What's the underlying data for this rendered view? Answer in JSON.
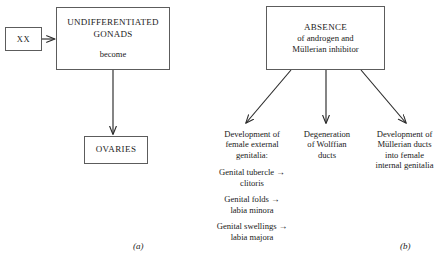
{
  "figure": {
    "background": "#ffffff",
    "line_color": "#5c5c5c",
    "arrow_color": "#2a2a2a",
    "text_color": "#1a1a1a"
  },
  "panel_a": {
    "label": "(a)",
    "karyotype_box": {
      "text": "XX"
    },
    "gonad_box": {
      "title_line1": "UNDIFFERENTIATED",
      "title_line2": "GONADS",
      "subtitle": "become"
    },
    "outcome_box": {
      "text": "OVARIES"
    }
  },
  "panel_b": {
    "label": "(b)",
    "absence_box": {
      "title": "ABSENCE",
      "line2": "of androgen and",
      "line3": "Müllerian inhibitor"
    },
    "outcomes": [
      {
        "name": "female-external-genitalia",
        "heading_line1": "Development of",
        "heading_line2": "female external",
        "heading_line3": "genitalia:",
        "items": [
          {
            "source": "Genital tubercle →",
            "result": "clitoris"
          },
          {
            "source": "Genital folds →",
            "result": "labia minora"
          },
          {
            "source": "Genital swellings →",
            "result": "labia majora"
          }
        ]
      },
      {
        "name": "wolffian-duct-degeneration",
        "line1": "Degeneration",
        "line2": "of Wolffian",
        "line3": "ducts"
      },
      {
        "name": "mullerian-duct-development",
        "line1": "Development of",
        "line2": "Müllerian ducts",
        "line3": "into female",
        "line4": "internal genitalia"
      }
    ]
  }
}
